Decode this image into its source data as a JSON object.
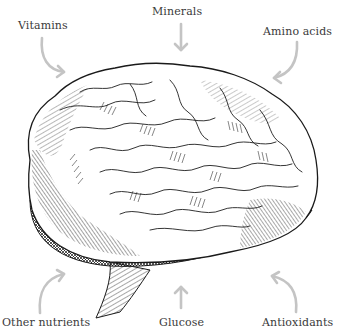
{
  "figure": {
    "arrow_color": "#c4c4c4",
    "text_color": "#3a3a3a",
    "labels": {
      "top_left": "Vitamins",
      "top_center": "Minerals",
      "top_right": "Amino acids",
      "bottom_left": "Other nutrients",
      "bottom_center": "Glucose",
      "bottom_right": "Antioxidants"
    }
  }
}
